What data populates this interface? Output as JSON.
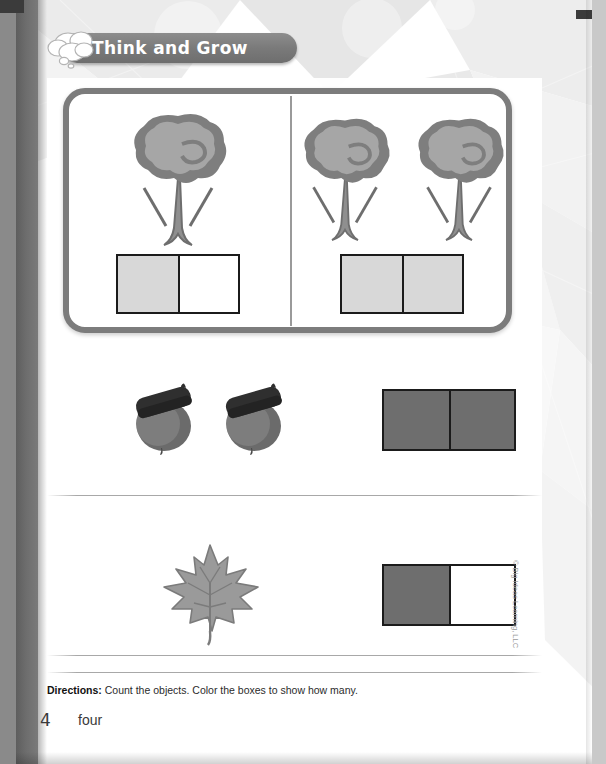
{
  "header": {
    "banner_title": "Think and Grow",
    "bubble_icon": "thought-bubble-icon"
  },
  "example_panel": {
    "left": {
      "object_icon": "tree-icon",
      "object_count": 1,
      "cells": [
        "light",
        "none"
      ]
    },
    "right": {
      "object_icon": "tree-icon",
      "object_count": 2,
      "cells": [
        "light",
        "light"
      ]
    }
  },
  "problems": [
    {
      "object_icon": "acorn-icon",
      "object_count": 2,
      "cells": [
        "dark",
        "dark"
      ]
    },
    {
      "object_icon": "leaf-icon",
      "object_count": 1,
      "cells": [
        "dark",
        "none"
      ]
    }
  ],
  "footer": {
    "directions_label": "Directions:",
    "directions_text": "Count the objects. Color the boxes to show how many.",
    "page_number": "4",
    "page_word": "four",
    "copyright": "© Big Ideas Learning, LLC"
  },
  "colors": {
    "banner": "#7a7a7a",
    "panel_border": "#7c7c7c",
    "fill_light": "#d8d8d8",
    "fill_dark": "#6e6e6e",
    "box_outline": "#1b1b1b"
  }
}
